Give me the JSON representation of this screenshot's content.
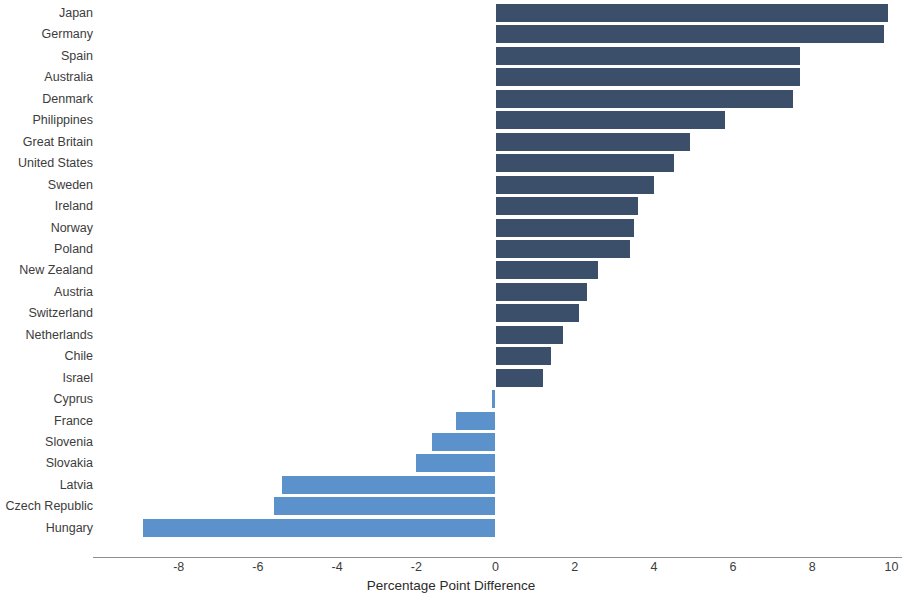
{
  "chart_data": {
    "type": "bar",
    "orientation": "horizontal",
    "title": "",
    "subtitle": "",
    "xlabel": "Percentage Point Difference",
    "ylabel": "",
    "xlim": [
      -9.4,
      10.2
    ],
    "xticks": [
      -8,
      -6,
      -4,
      -2,
      0,
      2,
      4,
      6,
      8,
      10
    ],
    "xticklabels": [
      "-8",
      "-6",
      "-4",
      "-2",
      "0",
      "2",
      "4",
      "6",
      "8",
      "10"
    ],
    "grid": false,
    "legend": null,
    "zero_baseline": 0,
    "colors": {
      "positive": "#3b4f6b",
      "negative": "#5b92cc",
      "axis": "#8e8e8e",
      "text": "#3c3c3c",
      "background": "#ffffff"
    },
    "categories": [
      "Japan",
      "Germany",
      "Spain",
      "Australia",
      "Denmark",
      "Philippines",
      "Great Britain",
      "United States",
      "Sweden",
      "Ireland",
      "Norway",
      "Poland",
      "New Zealand",
      "Austria",
      "Switzerland",
      "Netherlands",
      "Chile",
      "Israel",
      "Cyprus",
      "France",
      "Slovenia",
      "Slovakia",
      "Latvia",
      "Czech Republic",
      "Hungary"
    ],
    "values": [
      9.9,
      9.8,
      7.7,
      7.7,
      7.5,
      5.8,
      4.9,
      4.5,
      4.0,
      3.6,
      3.5,
      3.4,
      2.6,
      2.3,
      2.1,
      1.7,
      1.4,
      1.2,
      -0.1,
      -1.0,
      -1.6,
      -2.0,
      -5.4,
      -5.6,
      -8.9
    ]
  }
}
